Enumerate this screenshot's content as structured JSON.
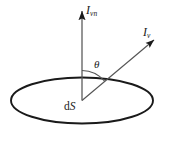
{
  "figure": {
    "background_color": "#ffffff",
    "stroke_color": "#1a1a1a",
    "labels": {
      "normal_intensity": {
        "symbol": "I",
        "subscript": "vn",
        "text": "I",
        "sub_text": "vn"
      },
      "directional_intensity": {
        "symbol": "I",
        "subscript": "v",
        "text": "I",
        "sub_text": "v"
      },
      "angle": {
        "text": "θ"
      },
      "surface_element": {
        "prefix": "d",
        "symbol": "S",
        "text": "d",
        "sub_text": "S"
      }
    },
    "geometry": {
      "ellipse": {
        "center_x": 82,
        "center_y": 100.5,
        "radius_x": 71,
        "radius_y": 23,
        "stroke_width": 1.8
      },
      "vertex": {
        "x": 82,
        "y": 100.5
      },
      "normal_arrow": {
        "from_x": 82,
        "from_y": 100.5,
        "to_x": 82,
        "to_y": 10
      },
      "directional_arrow": {
        "from_x": 82,
        "from_y": 100.5,
        "to_x": 155,
        "to_y": 39
      },
      "angle_arc": {
        "radius": 30,
        "start_deg": 90,
        "end_deg": 40
      }
    }
  }
}
